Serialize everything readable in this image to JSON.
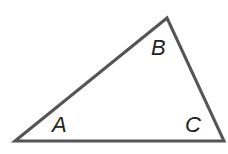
{
  "diagram": {
    "type": "triangle",
    "stroke_color": "#555555",
    "vertices": {
      "A": {
        "x": 15,
        "y": 141
      },
      "B": {
        "x": 167,
        "y": 18
      },
      "C": {
        "x": 224,
        "y": 141
      }
    },
    "labels": {
      "A": "A",
      "B": "B",
      "C": "C"
    }
  }
}
